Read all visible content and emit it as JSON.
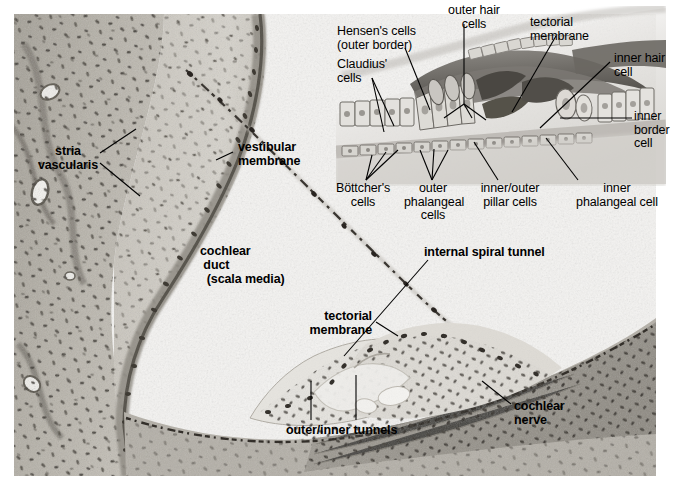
{
  "figure": {
    "width": 676,
    "height": 486,
    "background": "#ffffff",
    "ink": "#000000"
  },
  "histology": {
    "name": "cochlea-light-micrograph",
    "description": "Hematoxylin-eosin light micrograph of the cochlear duct (scala media), stria vascularis, vestibular membrane, organ of Corti and cochlear nerve",
    "stain_tones": [
      "#cfcdc6",
      "#b8b5ad",
      "#9b978e",
      "#6f6b63",
      "#4a463f"
    ]
  },
  "inset": {
    "name": "organ-of-corti-line-drawing",
    "description": "Grayscale schematic drawing of the organ of Corti shown in the upper right",
    "tones": [
      "#f2f1ef",
      "#dcdad6",
      "#bdbab4",
      "#97938c",
      "#6d6962",
      "#46423c"
    ]
  },
  "labels": {
    "histology": [
      {
        "id": "stria",
        "name": "label-stria-vascularis",
        "text": "stria\nvascularis",
        "style": "bold"
      },
      {
        "id": "vestib",
        "name": "label-vestibular-membrane",
        "text": "vestibular\nmembrane",
        "style": "bold"
      },
      {
        "id": "duct",
        "name": "label-cochlear-duct",
        "text": "cochlear\n duct\n  (scala media)",
        "style": "bold"
      },
      {
        "id": "ist",
        "name": "label-internal-spiral-tunnel",
        "text": "internal spiral tunnel",
        "style": "bold"
      },
      {
        "id": "tect2",
        "name": "label-tectorial-membrane-histology",
        "text": "tectorial\nmembrane",
        "style": "bold"
      },
      {
        "id": "tunnels",
        "name": "label-outer-inner-tunnels",
        "text": "outer/inner tunnels",
        "style": "bold"
      },
      {
        "id": "nerve",
        "name": "label-cochlear-nerve",
        "text": "cochlear\nnerve",
        "style": "bold"
      }
    ],
    "inset": [
      {
        "id": "hensen",
        "name": "label-hensens-cells",
        "text": "Hensen's cells\n(outer border)",
        "style": "plain"
      },
      {
        "id": "claudius",
        "name": "label-claudius-cells",
        "text": "Claudius'\ncells",
        "style": "plain"
      },
      {
        "id": "ohc",
        "name": "label-outer-hair-cells",
        "text": "outer hair\ncells",
        "style": "plain"
      },
      {
        "id": "tect1",
        "name": "label-tectorial-membrane-inset",
        "text": "tectorial\nmembrane",
        "style": "plain"
      },
      {
        "id": "ihc",
        "name": "label-inner-hair-cell",
        "text": "inner hair\ncell",
        "style": "plain"
      },
      {
        "id": "ibc",
        "name": "label-inner-border-cell",
        "text": "inner\nborder\ncell",
        "style": "plain"
      },
      {
        "id": "bott",
        "name": "label-bottchers-cells",
        "text": "Böttcher's\ncells",
        "style": "plain"
      },
      {
        "id": "outphal",
        "name": "label-outer-phalangeal-cells",
        "text": "outer\nphalangeal\ncells",
        "style": "plain"
      },
      {
        "id": "pillar",
        "name": "label-inner-outer-pillar-cells",
        "text": "inner/outer\npillar cells",
        "style": "plain"
      },
      {
        "id": "inphal",
        "name": "label-inner-phalangeal-cell",
        "text": "inner\nphalangeal cell",
        "style": "plain"
      }
    ]
  }
}
